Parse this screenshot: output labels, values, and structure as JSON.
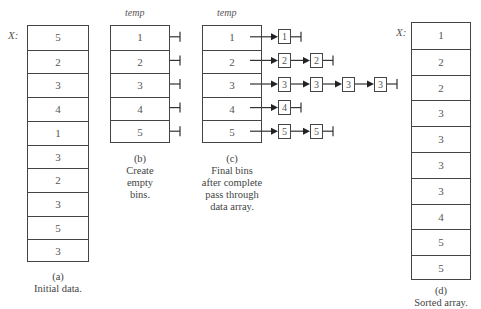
{
  "panel_a": {
    "array_label": "X:",
    "values": [
      "5",
      "2",
      "3",
      "4",
      "1",
      "3",
      "2",
      "3",
      "5",
      "3"
    ],
    "caption_letter": "(a)",
    "caption_text": "Initial data."
  },
  "panel_b": {
    "title": "temp",
    "bins": [
      "1",
      "2",
      "3",
      "4",
      "5"
    ],
    "caption_letter": "(b)",
    "caption_lines": [
      "Create",
      "empty",
      "bins."
    ]
  },
  "panel_c": {
    "title": "temp",
    "bins": [
      "1",
      "2",
      "3",
      "4",
      "5"
    ],
    "chains": [
      [
        "1"
      ],
      [
        "2",
        "2"
      ],
      [
        "3",
        "3",
        "3",
        "3"
      ],
      [
        "4"
      ],
      [
        "5",
        "5"
      ]
    ],
    "caption_letter": "(c)",
    "caption_lines": [
      "Final bins",
      "after complete",
      "pass through",
      "data array."
    ]
  },
  "panel_d": {
    "array_label": "X:",
    "values": [
      "1",
      "2",
      "2",
      "3",
      "3",
      "3",
      "3",
      "4",
      "5",
      "5"
    ],
    "caption_letter": "(d)",
    "caption_text": "Sorted array."
  }
}
